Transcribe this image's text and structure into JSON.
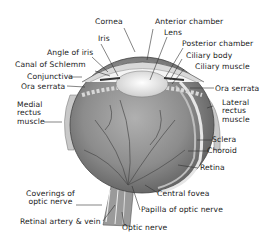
{
  "diagram": {
    "title": "",
    "labels": {
      "cornea": "Cornea",
      "anterior_chamber": "Anterior chamber",
      "iris": "Iris",
      "lens": "Lens",
      "angle_of_iris": "Angle of iris",
      "posterior_chamber": "Posterior chamber",
      "canal_of_schlemm": "Canal of Schlemm",
      "ciliary_body": "Ciliary body",
      "conjunctiva": "Conjunctiva",
      "ciliary_muscle": "Ciliary muscle",
      "ora_serrata_left": "Ora serrata",
      "ora_serrata_right": "Ora serrata",
      "medial_rectus": [
        "Medial",
        "rectus",
        "muscle"
      ],
      "lateral_rectus": [
        "Lateral",
        "rectus",
        "muscle"
      ],
      "sclera": "Sclera",
      "choroid": "Choroid",
      "retina": "Retina",
      "coverings_optic_nerve": [
        "Coverings of",
        "optic nerve"
      ],
      "central_fovea": "Central fovea",
      "papilla_optic_nerve": "Papilla of optic nerve",
      "retinal_artery_vein": "Retinal artery & vein",
      "optic_nerve": "Optic nerve"
    },
    "colors": {
      "background": "#ffffff",
      "eyeball": "#8a8a8a",
      "lens": "#e8e8e8",
      "text": "#1a1a1a",
      "leader": "#333333"
    }
  }
}
